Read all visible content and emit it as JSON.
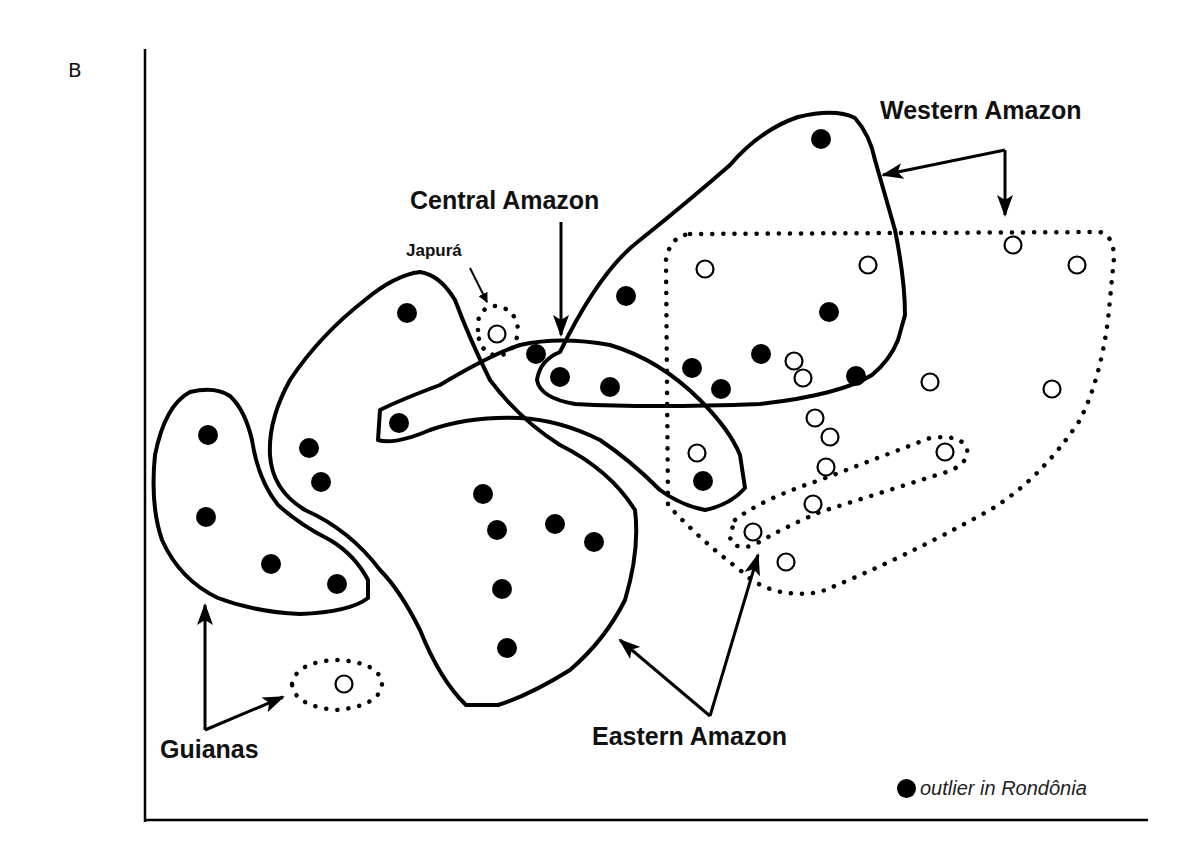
{
  "figure": {
    "panel_label": "B",
    "labels": {
      "western": "Western Amazon",
      "central": "Central Amazon",
      "japura": "Japurá",
      "guianas": "Guianas",
      "eastern": "Eastern Amazon"
    },
    "legend": {
      "symbol": "filled-circle",
      "text": "outlier in Rondônia"
    },
    "colors": {
      "ink": "#000000",
      "background": "#ffffff"
    }
  },
  "chart_data": {
    "type": "scatter",
    "title": "",
    "xlabel": "",
    "ylabel": "",
    "axes": {
      "x_axis": "bottom",
      "y_axis": "left",
      "ticks": false,
      "grid": false
    },
    "groups": [
      {
        "name": "Western Amazon",
        "outline": "solid",
        "marker": "filled",
        "points": [
          [
            821,
            139
          ],
          [
            626,
            296
          ],
          [
            829,
            312
          ],
          [
            761,
            354
          ],
          [
            692,
            368
          ],
          [
            721,
            389
          ],
          [
            856,
            376
          ]
        ]
      },
      {
        "name": "Western Amazon",
        "outline": "dotted",
        "marker": "open",
        "points": [
          [
            705,
            269
          ],
          [
            868,
            265
          ],
          [
            1013,
            245
          ],
          [
            1077,
            265
          ],
          [
            794,
            361
          ],
          [
            803,
            378
          ],
          [
            930,
            382
          ],
          [
            1052,
            389
          ],
          [
            815,
            418
          ],
          [
            830,
            437
          ],
          [
            826,
            467
          ],
          [
            813,
            504
          ],
          [
            697,
            453
          ]
        ]
      },
      {
        "name": "Central Amazon",
        "outline": "solid",
        "marker": "filled",
        "points": [
          [
            536,
            354
          ],
          [
            560,
            377
          ],
          [
            610,
            387
          ],
          [
            399,
            423
          ],
          [
            703,
            481
          ]
        ]
      },
      {
        "name": "Japurá",
        "outline": "dotted",
        "marker": "open",
        "points": [
          [
            497,
            334
          ]
        ]
      },
      {
        "name": "Eastern Amazon",
        "outline": "solid",
        "marker": "filled",
        "points": [
          [
            407,
            313
          ],
          [
            309,
            448
          ],
          [
            321,
            482
          ],
          [
            483,
            494
          ],
          [
            497,
            530
          ],
          [
            555,
            524
          ],
          [
            594,
            542
          ],
          [
            502,
            589
          ],
          [
            507,
            648
          ]
        ]
      },
      {
        "name": "Guianas",
        "outline": "solid",
        "marker": "filled",
        "points": [
          [
            208,
            435
          ],
          [
            206,
            517
          ],
          [
            271,
            564
          ],
          [
            337,
            584
          ]
        ]
      },
      {
        "name": "Guianas",
        "outline": "dotted",
        "marker": "open",
        "points": [
          [
            344,
            684
          ]
        ]
      },
      {
        "name": "Eastern Amazon",
        "outline": "dotted",
        "marker": "open",
        "points": [
          [
            945,
            452
          ],
          [
            753,
            532
          ],
          [
            786,
            562
          ]
        ]
      }
    ],
    "legend": [
      {
        "marker": "filled",
        "label": "outlier in Rondônia"
      }
    ]
  }
}
